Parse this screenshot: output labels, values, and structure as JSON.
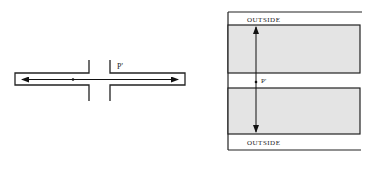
{
  "left_diagram": {
    "point_label": "P'"
  },
  "right_diagram": {
    "top_label": "OUTSIDE",
    "bottom_label": "OUTSIDE",
    "point_label": "P'",
    "fill_color": "#e4e4e4",
    "stroke_color": "#222222"
  }
}
